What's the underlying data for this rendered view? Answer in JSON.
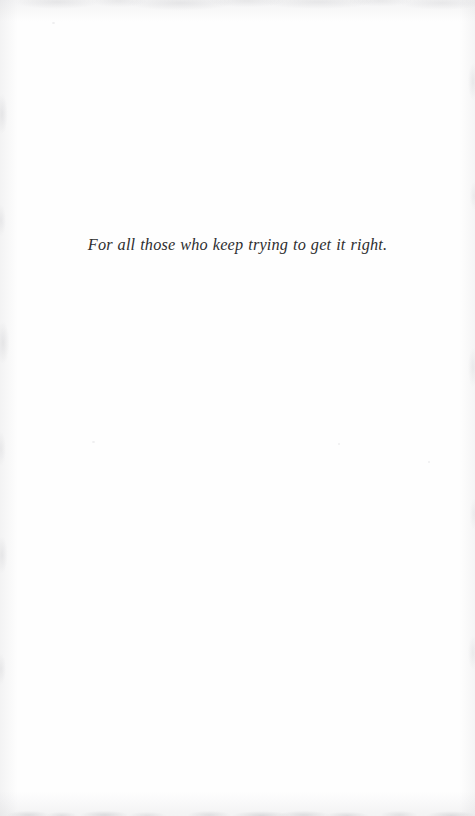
{
  "page": {
    "kind": "book-dedication-page",
    "width": 475,
    "height": 816,
    "background_color": "#fefefe",
    "paper_tone": "#fdfdfd",
    "edge_noise_color": "#96969c"
  },
  "dedication": {
    "text": "For all those who keep trying to get it right.",
    "style": "italic-serif",
    "ink_color": "#2e2e30",
    "alignment": "center",
    "font_size_px": 16,
    "baseline_y_px": 256,
    "span_x_px": [
      85,
      355
    ]
  },
  "body": {
    "running_head": "",
    "page_number": "",
    "folio": ""
  }
}
